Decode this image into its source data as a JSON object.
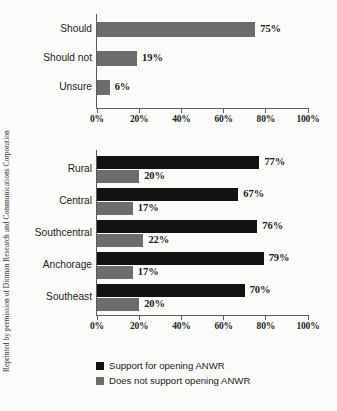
{
  "credit": "Reprinted by permission of Dittman Research and Communications Corporation",
  "legend": {
    "items": [
      {
        "label": "Support for opening ANWR",
        "color": "#121212",
        "key": "support"
      },
      {
        "label": "Does not support opening ANWR",
        "color": "#6c6c6c",
        "key": "oppose"
      }
    ]
  },
  "axis": {
    "ticks": [
      "0%",
      "20%",
      "40%",
      "60%",
      "80%",
      "100%"
    ],
    "min": 0,
    "max": 100
  },
  "chart_data": [
    {
      "type": "bar",
      "orientation": "horizontal",
      "title": "",
      "xlabel": "",
      "ylabel": "",
      "xlim": [
        0,
        100
      ],
      "grid": false,
      "legend_position": "none",
      "categories": [
        "Should",
        "Should not",
        "Unsure"
      ],
      "values": [
        75,
        19,
        6
      ],
      "value_labels": [
        "75%",
        "19%",
        "6%"
      ],
      "series": [
        {
          "name": "Does not support opening ANWR",
          "color": "#6c6c6c",
          "values": [
            75,
            19,
            6
          ]
        }
      ],
      "tick_labels": [
        "0%",
        "20%",
        "40%",
        "60%",
        "80%",
        "100%"
      ]
    },
    {
      "type": "bar",
      "orientation": "horizontal",
      "title": "",
      "xlabel": "",
      "ylabel": "",
      "xlim": [
        0,
        100
      ],
      "grid": false,
      "legend_position": "bottom",
      "categories": [
        "Rural",
        "Central",
        "Southcentral",
        "Anchorage",
        "Southeast"
      ],
      "series": [
        {
          "name": "Support for opening ANWR",
          "color": "#121212",
          "values": [
            77,
            67,
            76,
            79,
            70
          ],
          "value_labels": [
            "77%",
            "67%",
            "76%",
            "79%",
            "70%"
          ]
        },
        {
          "name": "Does not support opening ANWR",
          "color": "#6c6c6c",
          "values": [
            20,
            17,
            22,
            17,
            20
          ],
          "value_labels": [
            "20%",
            "17%",
            "22%",
            "17%",
            "20%"
          ]
        }
      ],
      "tick_labels": [
        "0%",
        "20%",
        "40%",
        "60%",
        "80%",
        "100%"
      ]
    }
  ]
}
